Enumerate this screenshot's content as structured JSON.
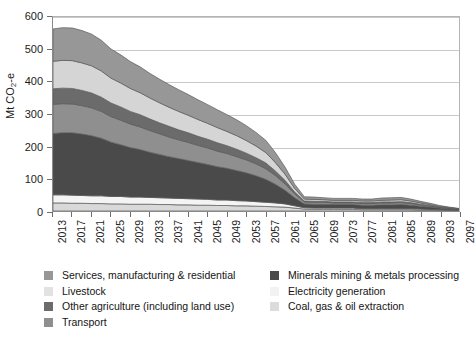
{
  "chart_data": {
    "type": "area",
    "stacked": true,
    "title": "",
    "subtitle": "",
    "xlabel": "",
    "ylabel": "Mt CO2-e",
    "ylabel_html": "Mt CO<sub>2</sub>-e",
    "ylim": [
      0,
      600
    ],
    "ytick_step": 100,
    "yticks": [
      0,
      100,
      200,
      300,
      400,
      500,
      600
    ],
    "grid": "horizontal",
    "legend_position": "bottom",
    "legend_columns": 2,
    "x": [
      2013,
      2015,
      2017,
      2019,
      2021,
      2023,
      2025,
      2027,
      2029,
      2031,
      2033,
      2035,
      2037,
      2039,
      2041,
      2043,
      2045,
      2047,
      2049,
      2051,
      2053,
      2055,
      2057,
      2059,
      2061,
      2063,
      2065,
      2067,
      2069,
      2071,
      2073,
      2075,
      2077,
      2079,
      2081,
      2083,
      2085,
      2087,
      2089,
      2091,
      2093,
      2095,
      2097
    ],
    "xticks": [
      2013,
      2017,
      2021,
      2025,
      2029,
      2033,
      2037,
      2041,
      2045,
      2049,
      2053,
      2057,
      2061,
      2065,
      2069,
      2073,
      2077,
      2081,
      2085,
      2089,
      2093,
      2097
    ],
    "xtick_labels": [
      "2013",
      "2017",
      "2021",
      "2025",
      "2029",
      "2033",
      "2037",
      "2041",
      "2045",
      "2049",
      "2053",
      "2057",
      "2061",
      "2065",
      "2069",
      "2073",
      "2077",
      "2081",
      "2085",
      "2089",
      "2093",
      "2097"
    ],
    "series": [
      {
        "name": "Coal, gas & oil extraction",
        "color": "#d9d9d9",
        "stack_order": 1,
        "values": [
          25,
          25,
          24,
          24,
          23,
          23,
          22,
          22,
          21,
          21,
          21,
          20,
          20,
          19,
          19,
          18,
          18,
          17,
          17,
          16,
          16,
          15,
          14,
          13,
          12,
          9,
          6,
          5,
          5,
          5,
          5,
          5,
          4,
          4,
          4,
          4,
          4,
          4,
          3,
          3,
          2,
          2,
          1
        ]
      },
      {
        "name": "Electricity generation",
        "color": "#f4f4f4",
        "stack_order": 2,
        "values": [
          25,
          25,
          25,
          24,
          24,
          24,
          23,
          23,
          22,
          22,
          21,
          21,
          20,
          20,
          19,
          19,
          18,
          17,
          17,
          16,
          15,
          14,
          13,
          12,
          10,
          7,
          4,
          4,
          4,
          4,
          4,
          4,
          3,
          3,
          3,
          3,
          3,
          3,
          3,
          2,
          2,
          1,
          1
        ]
      },
      {
        "name": "Minerals mining & metals processing",
        "color": "#4a4a4a",
        "stack_order": 3,
        "values": [
          190,
          192,
          193,
          190,
          186,
          178,
          168,
          160,
          153,
          147,
          140,
          134,
          128,
          123,
          118,
          113,
          108,
          103,
          98,
          93,
          87,
          80,
          71,
          58,
          42,
          25,
          12,
          12,
          12,
          11,
          11,
          11,
          11,
          11,
          12,
          12,
          13,
          11,
          9,
          7,
          5,
          3,
          2
        ]
      },
      {
        "name": "Transport",
        "color": "#8f8f8f",
        "stack_order": 4,
        "values": [
          90,
          90,
          89,
          88,
          86,
          83,
          79,
          76,
          73,
          70,
          67,
          64,
          61,
          58,
          56,
          53,
          51,
          48,
          46,
          43,
          40,
          37,
          33,
          27,
          20,
          12,
          6,
          6,
          6,
          5,
          5,
          5,
          5,
          5,
          6,
          6,
          6,
          5,
          4,
          3,
          2,
          2,
          1
        ]
      },
      {
        "name": "Other agriculture (including land use)",
        "color": "#6b6b6b",
        "stack_order": 5,
        "values": [
          48,
          48,
          48,
          47,
          46,
          44,
          42,
          41,
          39,
          38,
          36,
          34,
          33,
          31,
          30,
          28,
          27,
          26,
          24,
          23,
          21,
          19,
          18,
          14,
          11,
          6,
          3,
          3,
          3,
          3,
          3,
          3,
          3,
          3,
          3,
          3,
          3,
          3,
          2,
          2,
          1,
          1,
          1
        ]
      },
      {
        "name": "Livestock",
        "color": "#d5d5d5",
        "stack_order": 6,
        "values": [
          85,
          86,
          86,
          85,
          84,
          81,
          77,
          74,
          71,
          68,
          65,
          62,
          59,
          57,
          54,
          52,
          49,
          47,
          44,
          42,
          39,
          36,
          32,
          26,
          19,
          11,
          6,
          6,
          5,
          5,
          5,
          5,
          5,
          5,
          5,
          6,
          6,
          5,
          4,
          3,
          2,
          1,
          1
        ]
      },
      {
        "name": "Services, manufacturing & residential",
        "color": "#979797",
        "stack_order": 7,
        "values": [
          100,
          101,
          101,
          100,
          98,
          95,
          90,
          87,
          83,
          80,
          76,
          73,
          70,
          67,
          64,
          61,
          58,
          55,
          52,
          49,
          46,
          42,
          38,
          31,
          22,
          13,
          7,
          7,
          6,
          6,
          6,
          6,
          6,
          6,
          7,
          7,
          7,
          6,
          5,
          4,
          3,
          2,
          1
        ]
      }
    ],
    "totals": [
      563,
      567,
      566,
      558,
      547,
      528,
      501,
      483,
      462,
      446,
      426,
      408,
      391,
      375,
      360,
      344,
      329,
      313,
      298,
      282,
      264,
      243,
      219,
      181,
      136,
      83,
      44,
      43,
      41,
      39,
      39,
      39,
      37,
      37,
      40,
      41,
      42,
      37,
      30,
      24,
      17,
      12,
      8
    ]
  },
  "axes": {
    "y_title": "Mt CO",
    "y_title_sub": "2",
    "y_title_suffix": "-e",
    "ytick_labels": [
      "600",
      "500",
      "400",
      "300",
      "200",
      "100",
      "0"
    ]
  },
  "legend": {
    "left_column": [
      {
        "label": "Services, manufacturing & residential",
        "color": "#979797"
      },
      {
        "label": "Livestock",
        "color": "#e2e2e2"
      },
      {
        "label": "Other agriculture (including land use)",
        "color": "#6b6b6b"
      },
      {
        "label": "Transport",
        "color": "#8f8f8f"
      }
    ],
    "right_column": [
      {
        "label": "Minerals mining & metals processing",
        "color": "#4a4a4a"
      },
      {
        "label": "Electricity generation",
        "color": "#f2f2f2"
      },
      {
        "label": "Coal, gas & oil extraction",
        "color": "#dcdcdc"
      }
    ]
  },
  "style": {
    "grid_color": "#c9c9c9",
    "axis_color": "#8a8a8a",
    "text_color": "#1c1c1c",
    "background": "#ffffff",
    "series_outline": "#5a5a5a"
  }
}
